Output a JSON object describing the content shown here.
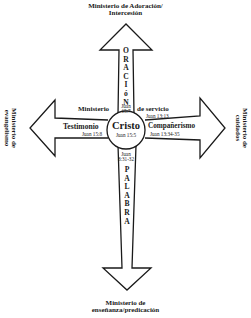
{
  "titles": {
    "top_line1": "Ministerio de Adoración/",
    "top_line2": "Intercesión",
    "left_line1": "Ministerio de",
    "left_line2": "evangelismo",
    "right_line1": "Ministerio de",
    "right_line2": "cuidados",
    "bottom_line1": "Ministerio de",
    "bottom_line2": "enseñanza/predicación"
  },
  "center": {
    "label": "Cristo",
    "ref": "Juan 15:5"
  },
  "up_arm": {
    "letters": [
      "O",
      "R",
      "A",
      "C",
      "I",
      "ó",
      "N"
    ],
    "ref_line1": "Juan",
    "ref_line2": "15:7"
  },
  "down_arm": {
    "letters": [
      "P",
      "A",
      "L",
      "A",
      "B",
      "R",
      "A"
    ],
    "ref_line1": "Juan",
    "ref_line2": "8:31-32"
  },
  "left_arm": {
    "label": "Testimonio",
    "ref": "Juan 15:8"
  },
  "right_arm": {
    "label": "Compañerismo",
    "ref": "Juan 13:34-35"
  },
  "cross_caption": {
    "left": "Ministerio",
    "right": "de servicio",
    "ref": "Juan 13:13"
  },
  "colors": {
    "stroke": "#1a1a1a",
    "background": "#ffffff"
  }
}
